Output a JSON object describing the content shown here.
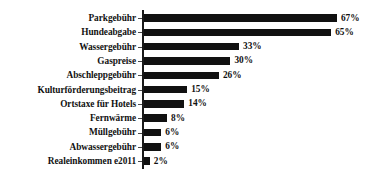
{
  "chart_data": {
    "type": "bar",
    "orientation": "horizontal",
    "title": "",
    "subtitle": "",
    "xlabel": "",
    "ylabel": "",
    "xlim": [
      0,
      70
    ],
    "grid": false,
    "legend": null,
    "value_suffix": "%",
    "categories": [
      "Parkgebühr",
      "Hundeabgabe",
      "Wassergebühr",
      "Gaspreise",
      "Abschleppgebühr",
      "Kulturförderungsbeitrag",
      "Ortstaxe für Hotels",
      "Fernwärme",
      "Müllgebühr",
      "Abwassergebühr",
      "Realeinkommen e2011"
    ],
    "values": [
      67,
      65,
      33,
      30,
      26,
      15,
      14,
      8,
      6,
      6,
      2
    ],
    "labels": [
      "67%",
      "65%",
      "33%",
      "30%",
      "26%",
      "15%",
      "14%",
      "8%",
      "6%",
      "6%",
      "2%"
    ],
    "colors": {
      "bar": "#111111",
      "axis": "#1a1a1a",
      "text": "#111111",
      "background": "#ffffff"
    }
  }
}
